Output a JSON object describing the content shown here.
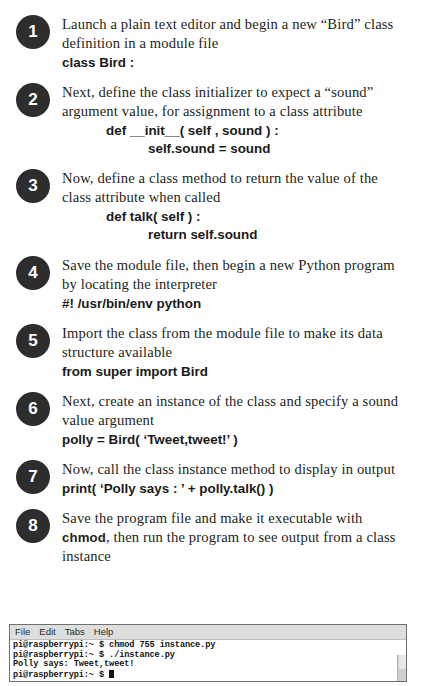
{
  "steps": [
    {
      "number": "1",
      "lines": [
        {
          "kind": "prose",
          "text": "Launch a plain text editor and begin a new “Bird” class definition in a module file"
        },
        {
          "kind": "code",
          "indent": 0,
          "text": "class Bird :"
        }
      ]
    },
    {
      "number": "2",
      "lines": [
        {
          "kind": "prose",
          "text": "Next, define the class initializer to expect a “sound” argument value, for assignment to a class attribute"
        },
        {
          "kind": "code",
          "indent": 1,
          "text": "def __init__( self , sound ) :"
        },
        {
          "kind": "code",
          "indent": 2,
          "text": "self.sound = sound"
        }
      ]
    },
    {
      "number": "3",
      "lines": [
        {
          "kind": "prose",
          "text": "Now, define a class method to return the value of the class attribute when called"
        },
        {
          "kind": "code",
          "indent": 1,
          "text": "def talk( self ) :"
        },
        {
          "kind": "code",
          "indent": 2,
          "text": "return self.sound"
        }
      ]
    },
    {
      "number": "4",
      "lines": [
        {
          "kind": "prose",
          "text": "Save the module file, then begin a new Python program by locating the interpreter"
        },
        {
          "kind": "code",
          "indent": 0,
          "text": "#! /usr/bin/env python"
        }
      ]
    },
    {
      "number": "5",
      "lines": [
        {
          "kind": "prose",
          "text": "Import the class from the module file to make its data structure available"
        },
        {
          "kind": "code",
          "indent": 0,
          "text": "from super import Bird"
        }
      ]
    },
    {
      "number": "6",
      "lines": [
        {
          "kind": "prose",
          "text": "Next, create an instance of the class and specify a sound value argument"
        },
        {
          "kind": "code",
          "indent": 0,
          "text": "polly = Bird( ‘Tweet,tweet!’ )"
        }
      ]
    },
    {
      "number": "7",
      "lines": [
        {
          "kind": "prose",
          "text": "Now, call the class instance method to display in output"
        },
        {
          "kind": "code",
          "indent": 0,
          "text": "print( ‘Polly says : ’ + polly.talk() )"
        }
      ]
    },
    {
      "number": "8",
      "lines": [
        {
          "kind": "prose-rich",
          "pre": "Save the program file and make it executable with ",
          "bold": "chmod",
          "post": ", then run the program to see output from a class instance"
        }
      ]
    }
  ],
  "terminal": {
    "menu": [
      "File",
      "Edit",
      "Tabs",
      "Help"
    ],
    "lines": [
      "pi@raspberrypi:~ $ chmod 755 instance.py",
      "pi@raspberrypi:~ $ ./instance.py",
      "Polly says: Tweet,tweet!"
    ],
    "prompt_last": "pi@raspberrypi:~ $ "
  },
  "colors": {
    "badge_bg": "#2d2d2d",
    "text": "#231f20",
    "terminal_menubar": "#dedede",
    "terminal_border": "#6f6f6f"
  }
}
